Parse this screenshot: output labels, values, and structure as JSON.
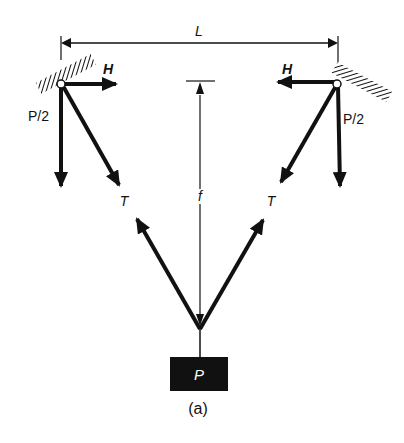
{
  "figure": {
    "caption": "(a)",
    "labels": {
      "span": "L",
      "sag": "f",
      "horizontal_left": "H",
      "horizontal_right": "H",
      "vertical_left": "P/2",
      "vertical_right": "P/2",
      "tension_left": "T",
      "tension_right": "T",
      "load": "P"
    },
    "colors": {
      "ink": "#111111",
      "background": "#ffffff"
    }
  }
}
